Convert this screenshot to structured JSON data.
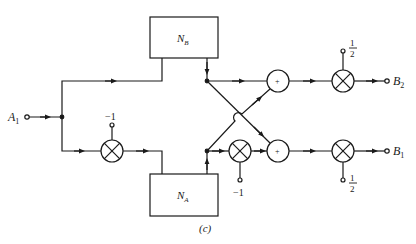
{
  "figure": {
    "caption": "(c)",
    "input": {
      "name": "A",
      "sub": "1"
    },
    "outputs": [
      {
        "name": "B",
        "sub": "2"
      },
      {
        "name": "B",
        "sub": "1"
      }
    ],
    "blocks": [
      {
        "id": "NB",
        "name": "N",
        "sub": "B"
      },
      {
        "id": "NA",
        "name": "N",
        "sub": "A"
      }
    ],
    "gains": {
      "input_inverter": "−1",
      "lower_inverter": "−1",
      "top_scale_num": "1",
      "top_scale_den": "2",
      "bottom_scale_num": "1",
      "bottom_scale_den": "2"
    },
    "adders": {
      "symbol": "+"
    }
  }
}
